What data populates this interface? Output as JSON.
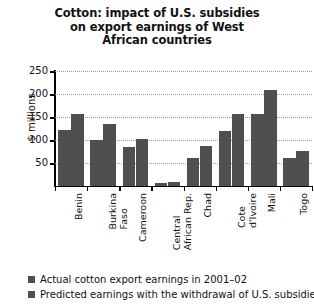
{
  "chart_data": {
    "type": "bar",
    "title": "Cotton: impact of U.S. subsidies on export earnings of West African countries",
    "title_lines": [
      "Cotton: impact of U.S. subsidies",
      "on export earnings of West",
      "African countries"
    ],
    "xlabel": "",
    "ylabel": "$ millions",
    "ylim": [
      0,
      250
    ],
    "ytick_values": [
      50,
      100,
      150,
      200,
      250
    ],
    "ytick_labels": [
      "50",
      "100",
      "150",
      "200",
      "250"
    ],
    "grid": true,
    "legend_position": "bottom-left",
    "categories": [
      "Benin",
      "Burkina Faso",
      "Cameroon",
      "Central African Rep.",
      "Chad",
      "Cote d'Ivoire",
      "Mali",
      "Togo"
    ],
    "category_label_lines": [
      [
        "Benin"
      ],
      [
        "Burkina",
        "Faso"
      ],
      [
        "Cameroon"
      ],
      [
        "Central",
        "African Rep."
      ],
      [
        "Chad"
      ],
      [
        "Cote",
        "d'Ivoire"
      ],
      [
        "Mali"
      ],
      [
        "Togo"
      ]
    ],
    "series": [
      {
        "name": "Actual cotton export earnings in 2001–02",
        "color": "#4f4f4f",
        "values": [
          122,
          100,
          85,
          6,
          60,
          120,
          157,
          60
        ]
      },
      {
        "name": "Predicted earnings with the withdrawal of U.S. subsidies",
        "color": "#4f4f4f",
        "values": [
          157,
          135,
          102,
          9,
          88,
          157,
          208,
          77
        ]
      }
    ]
  },
  "legend": {
    "items": [
      {
        "label": "Actual cotton export earnings in 2001–02",
        "color": "#4f4f4f"
      },
      {
        "label": "Predicted earnings with the withdrawal of U.S. subsidies",
        "color": "#4f4f4f"
      }
    ]
  }
}
